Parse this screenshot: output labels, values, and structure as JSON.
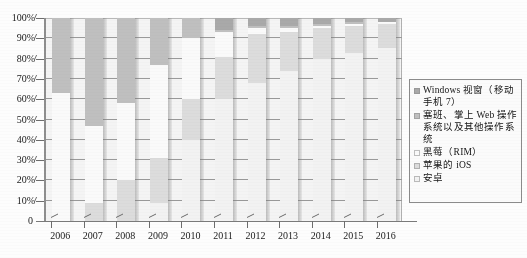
{
  "chart_data": {
    "type": "bar",
    "stacked": true,
    "title": "",
    "subtitle": "",
    "xlabel": "",
    "ylabel": "",
    "categories": [
      "2006",
      "2007",
      "2008",
      "2009",
      "2010",
      "2011",
      "2012",
      "2013",
      "2014",
      "2015",
      "2016"
    ],
    "ytick_labels": [
      "100%",
      "90%",
      "80%",
      "70%",
      "60%",
      "50%",
      "40%",
      "30%",
      "20%",
      "10%",
      "0"
    ],
    "ylim": [
      0,
      100
    ],
    "ytick_step": 10,
    "grid": true,
    "legend_position": "right",
    "series": [
      {
        "name": "安卓",
        "color": "#f2f2f2",
        "values": [
          0,
          0,
          0,
          9,
          40,
          60,
          68,
          74,
          80,
          83,
          85
        ]
      },
      {
        "name": "苹果的 iOS",
        "color": "#dcdcdc",
        "values": [
          0,
          9,
          20,
          22,
          20,
          21,
          24,
          19,
          15,
          13,
          12
        ]
      },
      {
        "name": "黑莓（RIM）",
        "color": "#fafafa",
        "values": [
          63,
          38,
          38,
          46,
          30,
          12,
          3,
          2,
          1,
          1,
          1
        ]
      },
      {
        "name": "塞班、掌上 Web 操作系统以及其他操作系统",
        "color": "#bfbfbf",
        "values": [
          37,
          53,
          42,
          23,
          10,
          1,
          1,
          1,
          1,
          1,
          0
        ]
      },
      {
        "name": "Windows 视窗（移动手机 7）",
        "color": "#a9a9a9",
        "values": [
          0,
          0,
          0,
          0,
          0,
          6,
          4,
          4,
          3,
          2,
          2
        ]
      }
    ]
  },
  "axes": {
    "y_ticks": [
      "100%",
      "90%",
      "80%",
      "70%",
      "60%",
      "50%",
      "40%",
      "30%",
      "20%",
      "10%"
    ],
    "zero_label": "0",
    "x_ticks": [
      "2006",
      "2007",
      "2008",
      "2009",
      "2010",
      "2011",
      "2012",
      "2013",
      "2014",
      "2015",
      "2016"
    ]
  },
  "legend": {
    "items": [
      {
        "label": "Windows 视窗（移动手机 7）",
        "color": "#a9a9a9"
      },
      {
        "label": "塞班、掌上 Web 操作系统以及其他操作系统",
        "color": "#bfbfbf"
      },
      {
        "label": "黑莓（RIM）",
        "color": "#fafafa"
      },
      {
        "label": "苹果的 iOS",
        "color": "#dcdcdc"
      },
      {
        "label": "安卓",
        "color": "#f2f2f2"
      }
    ]
  },
  "colors": {
    "grid": "#9a9a9a",
    "axis": "#6d6d6d",
    "plot_background": "#f4f4f4",
    "legend_border": "#8b8b8b"
  }
}
